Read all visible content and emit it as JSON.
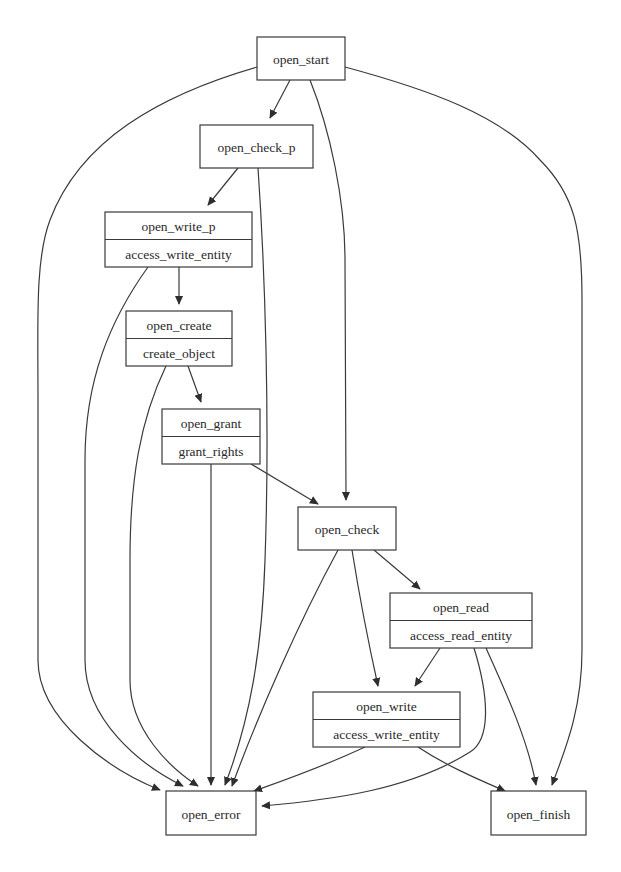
{
  "diagram": {
    "type": "state-flow-graph",
    "colors": {
      "background": "#ffffff",
      "stroke": "#3a3a3a",
      "text": "#2a2a2a"
    },
    "nodes": [
      {
        "id": "open_start",
        "label": "open_start",
        "sublabel": null,
        "x": 257,
        "y": 37,
        "w": 88,
        "h": 43
      },
      {
        "id": "open_check_p",
        "label": "open_check_p",
        "sublabel": null,
        "x": 200,
        "y": 125,
        "w": 113,
        "h": 43
      },
      {
        "id": "open_write_p",
        "label": "open_write_p",
        "sublabel": "access_write_entity",
        "x": 105,
        "y": 212,
        "w": 147,
        "h": 55
      },
      {
        "id": "open_create",
        "label": "open_create",
        "sublabel": "create_object",
        "x": 126,
        "y": 311,
        "w": 106,
        "h": 55
      },
      {
        "id": "open_grant",
        "label": "open_grant",
        "sublabel": "grant_rights",
        "x": 162,
        "y": 409,
        "w": 98,
        "h": 55
      },
      {
        "id": "open_check",
        "label": "open_check",
        "sublabel": null,
        "x": 298,
        "y": 507,
        "w": 98,
        "h": 43
      },
      {
        "id": "open_read",
        "label": "open_read",
        "sublabel": "access_read_entity",
        "x": 390,
        "y": 593,
        "w": 142,
        "h": 55
      },
      {
        "id": "open_write",
        "label": "open_write",
        "sublabel": "access_write_entity",
        "x": 313,
        "y": 692,
        "w": 147,
        "h": 55
      },
      {
        "id": "open_error",
        "label": "open_error",
        "sublabel": null,
        "x": 166,
        "y": 791,
        "w": 90,
        "h": 44
      },
      {
        "id": "open_finish",
        "label": "open_finish",
        "sublabel": null,
        "x": 491,
        "y": 791,
        "w": 95,
        "h": 44
      }
    ],
    "edges": [
      {
        "from": "open_start",
        "to": "open_check_p",
        "path": "M290,80 L270,118"
      },
      {
        "from": "open_start",
        "to": "open_check",
        "path": "M310,80 C330,130 345,200 345,260 L346,500"
      },
      {
        "from": "open_start",
        "to": "open_error",
        "path": "M257,67 C160,95 80,140 50,220 C35,260 38,320 38,400 L38,660 C38,720 110,770 160,790"
      },
      {
        "from": "open_start",
        "to": "open_finish",
        "path": "M345,67 C430,90 500,115 540,160 C575,195 582,230 582,300 L582,650 C582,710 565,750 552,785"
      },
      {
        "from": "open_check_p",
        "to": "open_write_p",
        "path": "M238,168 L208,205"
      },
      {
        "from": "open_check_p",
        "to": "open_error",
        "path": "M258,168 C265,270 270,420 265,560 C262,650 250,720 225,785"
      },
      {
        "from": "open_write_p",
        "to": "open_create",
        "path": "M179,267 L179,304"
      },
      {
        "from": "open_write_p",
        "to": "open_error",
        "path": "M148,267 C110,320 85,380 85,460 L85,660 C85,720 140,765 183,786"
      },
      {
        "from": "open_create",
        "to": "open_grant",
        "path": "M188,366 L201,402"
      },
      {
        "from": "open_create",
        "to": "open_error",
        "path": "M166,366 C140,420 130,480 130,560 L130,680 C130,730 170,768 198,786"
      },
      {
        "from": "open_grant",
        "to": "open_check",
        "path": "M251,464 L318,504"
      },
      {
        "from": "open_grant",
        "to": "open_error",
        "path": "M211,464 L211,785"
      },
      {
        "from": "open_check",
        "to": "open_read",
        "path": "M374,550 L420,589"
      },
      {
        "from": "open_check",
        "to": "open_write",
        "path": "M352,550 C360,600 370,650 378,686"
      },
      {
        "from": "open_check",
        "to": "open_error",
        "path": "M338,550 C300,620 260,710 232,786"
      },
      {
        "from": "open_read",
        "to": "open_write",
        "path": "M440,648 L415,686"
      },
      {
        "from": "open_read",
        "to": "open_finish",
        "path": "M486,648 C505,690 528,740 536,785"
      },
      {
        "from": "open_read",
        "to": "open_error",
        "path": "M474,648 C490,700 490,740 470,752 C410,790 330,800 262,806"
      },
      {
        "from": "open_write",
        "to": "open_error",
        "path": "M365,747 C320,768 285,780 254,791"
      },
      {
        "from": "open_write",
        "to": "open_finish",
        "path": "M418,747 C445,765 475,778 505,791"
      }
    ]
  }
}
